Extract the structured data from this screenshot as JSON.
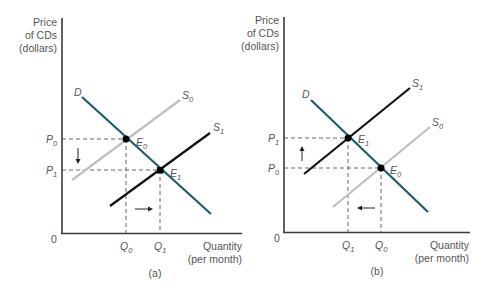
{
  "panels": [
    {
      "id": "a",
      "caption": "(a)",
      "y_axis_label": [
        "Price",
        "of CDs",
        "(dollars)"
      ],
      "x_axis_label": [
        "Quantity",
        "(per month)"
      ],
      "origin_label": "0",
      "curves": {
        "demand": {
          "label": "D"
        },
        "supply_initial": {
          "label": "S",
          "sub": "0"
        },
        "supply_new": {
          "label": "S",
          "sub": "1"
        }
      },
      "equilibria": [
        {
          "label": "E",
          "sub": "0",
          "price": {
            "label": "P",
            "sub": "0"
          },
          "quantity": {
            "label": "Q",
            "sub": "0"
          }
        },
        {
          "label": "E",
          "sub": "1",
          "price": {
            "label": "P",
            "sub": "1"
          },
          "quantity": {
            "label": "Q",
            "sub": "1"
          }
        }
      ],
      "shift": "supply increases: price falls, quantity rises"
    },
    {
      "id": "b",
      "caption": "(b)",
      "y_axis_label": [
        "Price",
        "of CDs",
        "(dollars)"
      ],
      "x_axis_label": [
        "Quantity",
        "(per month)"
      ],
      "origin_label": "0",
      "curves": {
        "demand": {
          "label": "D"
        },
        "supply_initial": {
          "label": "S",
          "sub": "0"
        },
        "supply_new": {
          "label": "S",
          "sub": "1"
        }
      },
      "equilibria": [
        {
          "label": "E",
          "sub": "1",
          "price": {
            "label": "P",
            "sub": "1"
          },
          "quantity": {
            "label": "Q",
            "sub": "1"
          }
        },
        {
          "label": "E",
          "sub": "0",
          "price": {
            "label": "P",
            "sub": "0"
          },
          "quantity": {
            "label": "Q",
            "sub": "0"
          }
        }
      ],
      "shift": "supply decreases: price rises, quantity falls"
    }
  ],
  "colors": {
    "demand": "#1f5c6b",
    "supply_new": "#111111",
    "supply_initial": "#bfbfbf",
    "axis": "#3a3a3a",
    "text": "#555555"
  }
}
